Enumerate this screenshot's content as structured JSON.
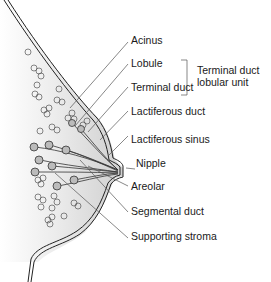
{
  "diagram": {
    "labels": [
      {
        "id": "acinus",
        "text": "Acinus"
      },
      {
        "id": "lobule",
        "text": "Lobule"
      },
      {
        "id": "terminal-duct",
        "text": "Terminal duct"
      },
      {
        "id": "lactiferous-duct",
        "text": "Lactiferous duct"
      },
      {
        "id": "lactiferous-sinus",
        "text": "Lactiferous sinus"
      },
      {
        "id": "nipple",
        "text": "Nipple"
      },
      {
        "id": "areolar",
        "text": "Areolar"
      },
      {
        "id": "segmental-duct",
        "text": "Segmental duct"
      },
      {
        "id": "supporting-stroma",
        "text": "Supporting stroma"
      }
    ],
    "group": {
      "line1": "Terminal duct",
      "line2": "lobular unit"
    }
  }
}
